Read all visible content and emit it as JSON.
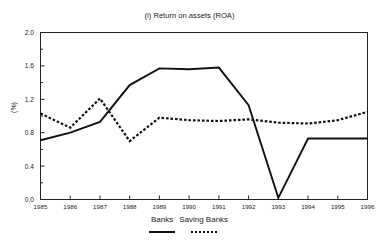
{
  "clipped_caption": "",
  "chart_data": {
    "type": "line",
    "title": "(i) Return on assets (ROA)",
    "xlabel": "",
    "ylabel": "(%)",
    "grid": false,
    "legend_position": "bottom-center",
    "x": [
      1985,
      1986,
      1987,
      1988,
      1989,
      1990,
      1991,
      1992,
      1993,
      1994,
      1995,
      1996
    ],
    "categories": [
      "1985",
      "1986",
      "1987",
      "1988",
      "1989",
      "1990",
      "1991",
      "1992",
      "1993",
      "1994",
      "1995",
      "1996"
    ],
    "xlim": [
      1985,
      1996
    ],
    "ylim": [
      0.0,
      2.0
    ],
    "ytick_values": [
      0.0,
      0.4,
      0.8,
      1.2,
      1.6,
      2.0
    ],
    "ytick_labels": [
      "0.0",
      "0.4",
      "0.8",
      "1.2",
      "1.6",
      "2.0"
    ],
    "yminor_step": 0.2,
    "series": [
      {
        "name": "Banks",
        "style": "solid",
        "color": "#111111",
        "values": [
          0.71,
          0.8,
          0.93,
          1.37,
          1.57,
          1.56,
          1.58,
          1.13,
          0.02,
          0.73,
          0.73,
          0.73
        ]
      },
      {
        "name": "Saving Banks",
        "style": "dotted",
        "color": "#111111",
        "values": [
          1.03,
          0.86,
          1.21,
          0.7,
          0.98,
          0.95,
          0.94,
          0.96,
          0.92,
          0.91,
          0.95,
          1.05
        ]
      }
    ]
  },
  "legend": {
    "items": [
      {
        "label": "Banks",
        "style": "solid"
      },
      {
        "label": "Saving Banks",
        "style": "dotted"
      }
    ]
  }
}
